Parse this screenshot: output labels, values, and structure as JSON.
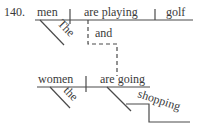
{
  "diagram": {
    "number": "140.",
    "clause1": {
      "subject": "men",
      "subject_modifier": "The",
      "verb": "are playing",
      "object": "golf"
    },
    "conjunction": "and",
    "clause2": {
      "subject": "women",
      "subject_modifier": "the",
      "verb": "are going",
      "verb_complement": "shopping"
    }
  }
}
